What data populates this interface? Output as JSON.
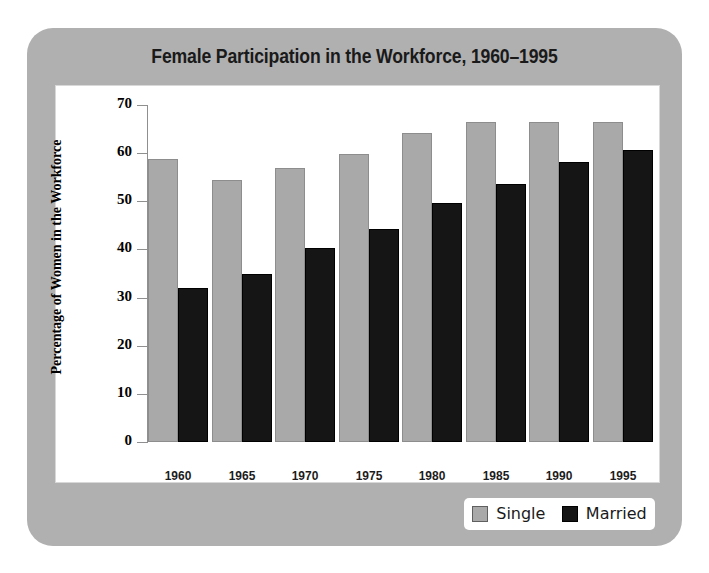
{
  "chart_data": {
    "type": "bar",
    "title": "Female Participation in the Workforce, 1960–1995",
    "xlabel": "",
    "ylabel": "Percentage of Women in the Workforce",
    "categories": [
      "1960",
      "1965",
      "1970",
      "1975",
      "1980",
      "1985",
      "1990",
      "1995"
    ],
    "series": [
      {
        "name": "Single",
        "color": "#a9a9a9",
        "values": [
          58.8,
          54.5,
          56.9,
          59.8,
          64.2,
          66.4,
          66.5,
          66.4
        ]
      },
      {
        "name": "Married",
        "color": "#151515",
        "values": [
          32.0,
          34.8,
          40.2,
          44.2,
          49.6,
          53.5,
          58.2,
          60.7
        ]
      }
    ],
    "ylim": [
      0,
      70
    ],
    "yticks": [
      "70",
      "60",
      "50",
      "40",
      "30",
      "20",
      "10",
      "0"
    ],
    "ytick_values": [
      70,
      60,
      50,
      40,
      30,
      20,
      10,
      0
    ],
    "grid": false,
    "legend_position": "bottom-right"
  },
  "legend": {
    "entries": [
      {
        "label": "Single",
        "swatch": "gray-square-swatch"
      },
      {
        "label": "Married",
        "swatch": "black-square-swatch"
      }
    ]
  },
  "colors": {
    "panel_background": "#b0b0b0",
    "plot_background": "#ffffff",
    "single_bar": "#a9a9a9",
    "married_bar": "#151515",
    "axis": "#8f8f8f",
    "text": "#1a1a1a"
  }
}
